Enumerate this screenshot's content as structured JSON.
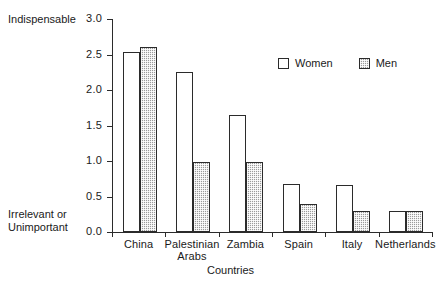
{
  "chart_data": {
    "type": "bar",
    "title": "",
    "xlabel": "Countries",
    "ylabel": "",
    "ylim": [
      0.0,
      3.0
    ],
    "yticks": [
      "0.0",
      "0.5",
      "1.0",
      "1.5",
      "2.0",
      "2.5",
      "3.0"
    ],
    "ytick_values": [
      0.0,
      0.5,
      1.0,
      1.5,
      2.0,
      2.5,
      3.0
    ],
    "y_axis_top_label": "Indispensable",
    "y_axis_bottom_label_line1": "Irrelevant or",
    "y_axis_bottom_label_line2": "Unimportant",
    "grid": false,
    "legend_position": "upper-right-inside",
    "categories": [
      "China",
      "Palestinian Arabs",
      "Zambia",
      "Spain",
      "Italy",
      "Netherlands"
    ],
    "category_labels": [
      {
        "line1": "China",
        "line2": ""
      },
      {
        "line1": "Palestinian",
        "line2": "Arabs"
      },
      {
        "line1": "Zambia",
        "line2": ""
      },
      {
        "line1": "Spain",
        "line2": ""
      },
      {
        "line1": "Italy",
        "line2": ""
      },
      {
        "line1": "Netherlands",
        "line2": ""
      }
    ],
    "series": [
      {
        "name": "Women",
        "values": [
          2.53,
          2.25,
          1.65,
          0.67,
          0.66,
          0.3
        ]
      },
      {
        "name": "Men",
        "values": [
          2.6,
          0.99,
          0.99,
          0.4,
          0.29,
          0.3
        ]
      }
    ]
  },
  "legend": {
    "items": [
      {
        "label": "Women",
        "style": "white"
      },
      {
        "label": "Men",
        "style": "hatched-gray"
      }
    ]
  },
  "colors": {
    "axis": "#2b2b2b",
    "women_fill": "#ffffff",
    "men_fill": "#9b9b9b",
    "background": "#ffffff"
  }
}
